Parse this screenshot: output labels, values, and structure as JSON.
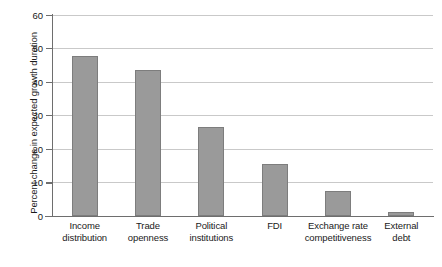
{
  "chart_data": {
    "type": "bar",
    "title": "",
    "subtitle": "",
    "xlabel": "",
    "ylabel": "Percent change in expected growth duration",
    "categories": [
      "Income distribution",
      "Trade openness",
      "Political institutions",
      "FDI",
      "Exchange rate competitiveness",
      "External debt"
    ],
    "category_lines": [
      [
        "Income",
        "distribution"
      ],
      [
        "Trade",
        "openness"
      ],
      [
        "Political",
        "institutions"
      ],
      [
        "FDI"
      ],
      [
        "Exchange rate",
        "competitiveness"
      ],
      [
        "External",
        "debt"
      ]
    ],
    "values": [
      47.5,
      43.5,
      26.5,
      15.5,
      7.5,
      1.3
    ],
    "ylim": [
      0,
      60
    ],
    "ytick_labels": [
      "0",
      "10",
      "20",
      "30",
      "40",
      "50",
      "60"
    ],
    "ytick_values": [
      0,
      10,
      20,
      30,
      40,
      50,
      60
    ],
    "grid": "horizontal",
    "legend": "none",
    "bar_color": "#9a9a9a",
    "bar_border_color": "#7d7d7d",
    "axis_color": "#6e6e6e",
    "gridline_color": "#c9c9c9",
    "background_color": "#ffffff",
    "text_color": "#1a1a1a"
  }
}
